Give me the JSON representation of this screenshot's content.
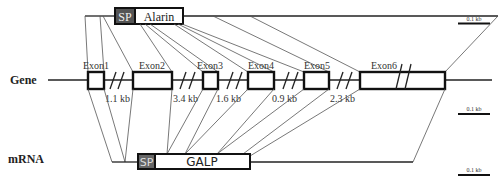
{
  "labels": {
    "gene": "Gene",
    "mrna": "mRNA"
  },
  "peptide": {
    "sp_label": "SP",
    "name": "Alarin",
    "sp_color": "#555555"
  },
  "transcript": {
    "sp_label": "SP",
    "name": "GALP",
    "sp_color": "#666666"
  },
  "exons": [
    {
      "label": "Exon1",
      "x": 88,
      "w": 16
    },
    {
      "label": "Exon2",
      "x": 133,
      "w": 39
    },
    {
      "label": "Exon3",
      "x": 203,
      "w": 15
    },
    {
      "label": "Exon4",
      "x": 248,
      "w": 26
    },
    {
      "label": "Exon5",
      "x": 304,
      "w": 25
    },
    {
      "label": "Exon6",
      "x": 360,
      "w": 85
    }
  ],
  "introns": [
    {
      "label": "1.1 kb",
      "x": 104
    },
    {
      "label": "3.4 kb",
      "x": 173
    },
    {
      "label": "1.6 kb",
      "x": 216
    },
    {
      "label": "0.9 kb",
      "x": 272
    },
    {
      "label": "2.3 kb",
      "x": 330
    }
  ],
  "scale_bars": [
    {
      "label": "0.1 kb",
      "y": 23
    },
    {
      "label": "0.1 kb",
      "y": 114
    },
    {
      "label": "0.1 kb",
      "y": 175
    }
  ]
}
